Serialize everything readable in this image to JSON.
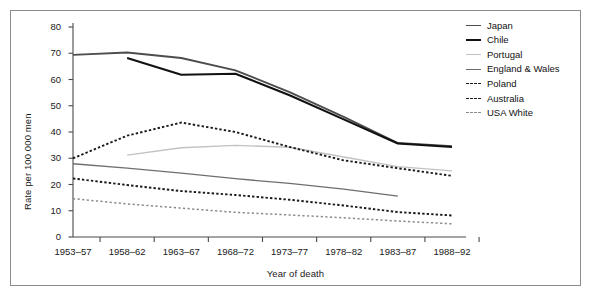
{
  "chart_data": {
    "type": "line",
    "title": "",
    "xlabel": "Year of death",
    "ylabel": "Rate per 100 000 men",
    "categories": [
      "1953–57",
      "1958–62",
      "1963–67",
      "1968–72",
      "1973–77",
      "1978–82",
      "1983–87",
      "1988–92"
    ],
    "ylim": [
      0,
      80
    ],
    "yticks": [
      0,
      10,
      20,
      30,
      40,
      50,
      60,
      70,
      80
    ],
    "grid": false,
    "legend_position": "top-right",
    "series": [
      {
        "name": "Japan",
        "color": "#4d4d4d",
        "style": "solid",
        "width": 1.9,
        "values": [
          69.4,
          70.3,
          68.2,
          63.5,
          55.2,
          45.8,
          35.8,
          34.6
        ]
      },
      {
        "name": "Chile",
        "color": "#111111",
        "style": "solid",
        "width": 2.1,
        "values": [
          null,
          68.2,
          61.8,
          62.2,
          54.0,
          44.8,
          35.6,
          34.3
        ]
      },
      {
        "name": "Portugal",
        "color": "#c2c2c2",
        "style": "solid",
        "width": 1.4,
        "values": [
          null,
          31.2,
          34.0,
          34.9,
          34.2,
          30.5,
          26.8,
          25.2
        ]
      },
      {
        "name": "England & Wales",
        "color": "#6e6e6e",
        "style": "solid",
        "width": 1.3,
        "values": [
          27.9,
          26.2,
          24.3,
          22.2,
          20.4,
          18.2,
          15.6,
          null
        ]
      },
      {
        "name": "Poland",
        "color": "#1a1a1a",
        "style": "dashed",
        "width": 1.9,
        "values": [
          30.0,
          38.6,
          43.6,
          40.0,
          34.3,
          29.2,
          26.2,
          23.3
        ]
      },
      {
        "name": "Australia",
        "color": "#1a1a1a",
        "style": "dashed",
        "width": 1.9,
        "values": [
          22.3,
          19.8,
          17.5,
          16.0,
          14.2,
          12.0,
          9.5,
          8.2
        ]
      },
      {
        "name": "USA White",
        "color": "#8a8a8a",
        "style": "dashed",
        "width": 1.5,
        "values": [
          14.6,
          12.6,
          11.0,
          9.4,
          8.4,
          7.3,
          6.1,
          5.0
        ]
      }
    ]
  },
  "legend": {
    "items": [
      {
        "label": "Japan"
      },
      {
        "label": "Chile"
      },
      {
        "label": "Portugal"
      },
      {
        "label": "England & Wales"
      },
      {
        "label": "Poland"
      },
      {
        "label": "Australia"
      },
      {
        "label": "USA White"
      }
    ]
  }
}
